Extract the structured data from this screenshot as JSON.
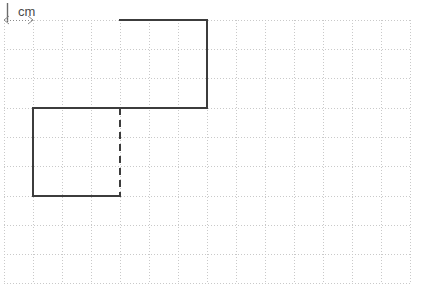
{
  "figure": {
    "background_color": "#ffffff",
    "canvas": {
      "width": 426,
      "height": 296
    }
  },
  "scale_key": {
    "label": "cm",
    "tick_glyph": "vertical-tick",
    "arrow_left_glyph": "arrow-left",
    "arrow_right_glyph": "arrow-right",
    "unit_length_px": 29,
    "description": "1 cm scale marker spanning one grid square",
    "color": "#6b6b6b",
    "text_x": 18,
    "text_y": 16,
    "tick_x": 7,
    "tick_y1": 3,
    "tick_y2": 22,
    "span_y": 20,
    "span_x1": 4,
    "span_x2": 33
  },
  "grid": {
    "line_color": "#c9c9c9",
    "line_width": 1,
    "dash_pattern": "1,2",
    "cell_size_px": 29,
    "origin_x": 4,
    "origin_y": 20,
    "columns": 14,
    "rows": 9,
    "vertical_lines_x": [
      4,
      33,
      62,
      91,
      120,
      149,
      178,
      207,
      236,
      265,
      294,
      323,
      352,
      381,
      410
    ],
    "horizontal_lines_y": [
      20,
      49,
      78,
      108,
      137,
      166,
      196,
      225,
      254,
      283
    ]
  },
  "shape": {
    "name": "two-squares-diagonal",
    "stroke_color": "#3c3c3c",
    "stroke_width": 2,
    "dashed_stroke_color": "#3c3c3c",
    "dashed_pattern": "7,5",
    "cells_per_side": 3,
    "solid_path": "M 120 20 L 207 20 L 207 108 L 120 108 L 33 108 L 33 196 L 120 196",
    "dashed_segments": [
      {
        "name": "horizontal-internal-edge",
        "x1": 120,
        "y1": 108,
        "x2": 207,
        "y2": 108
      },
      {
        "name": "vertical-internal-edge",
        "x1": 120,
        "y1": 108,
        "x2": 120,
        "y2": 196
      }
    ],
    "upper_square": {
      "x": 120,
      "y": 20,
      "width": 87,
      "height": 87
    },
    "lower_square": {
      "x": 33,
      "y": 108,
      "width": 87,
      "height": 87
    }
  }
}
